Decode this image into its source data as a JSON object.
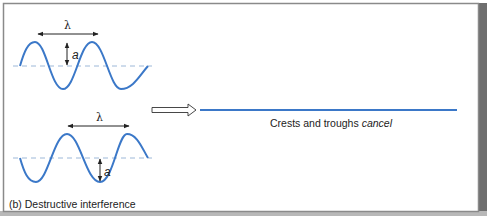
{
  "panel": {
    "caption": "(b) Destructive interference",
    "result_text": "Crests and troughs",
    "result_emphasis": "cancel"
  },
  "wave_top": {
    "wavelength_symbol": "λ",
    "amplitude_symbol": "a"
  },
  "wave_bottom": {
    "wavelength_symbol": "λ",
    "amplitude_symbol": "a"
  },
  "colors": {
    "wave": "#3b78c8",
    "baseline_dash": "#9db8d8",
    "arrow": "#222222",
    "frame_border": "#8a8a8a",
    "frame_shadow": "#6e6e6e",
    "background": "#ffffff"
  },
  "icons": {
    "hollow_arrow": "right-hollow-arrow-icon"
  }
}
